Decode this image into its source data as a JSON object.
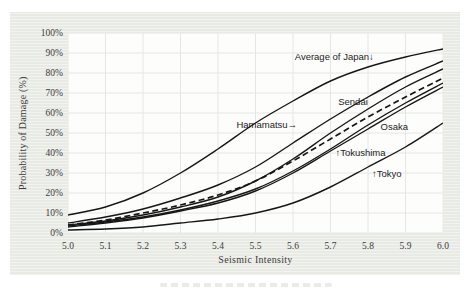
{
  "colors": {
    "curve": "#161616",
    "grid": "#e5e8e2",
    "panel_bg": "#e8eae4",
    "plot_bg": "#fdfdfc",
    "text": "#3b3b3b"
  },
  "chart_data": {
    "type": "line",
    "title": "",
    "xlabel": "Seismic Intensity",
    "ylabel": "Probability of Damage (%)",
    "xlim": [
      5.0,
      6.0
    ],
    "ylim": [
      0,
      100
    ],
    "grid": true,
    "x_ticks": [
      "5.0",
      "5.1",
      "5.2",
      "5.3",
      "5.4",
      "5.5",
      "5.6",
      "5.7",
      "5.8",
      "5.9",
      "6.0"
    ],
    "y_ticks": [
      "0%",
      "10%",
      "20%",
      "30%",
      "40%",
      "50%",
      "60%",
      "70%",
      "80%",
      "90%",
      "100%"
    ],
    "x": [
      5.0,
      5.1,
      5.2,
      5.3,
      5.4,
      5.5,
      5.6,
      5.7,
      5.8,
      5.9,
      6.0
    ],
    "series": [
      {
        "name": "Average of Japan",
        "style": "solid",
        "values": [
          9,
          13,
          20,
          30,
          42,
          55,
          66,
          76,
          83,
          88,
          92
        ]
      },
      {
        "name": "Sendai",
        "style": "solid",
        "values": [
          5,
          8,
          12,
          17.5,
          24,
          33,
          45,
          57,
          68,
          78,
          86
        ]
      },
      {
        "name": "Hamamatsu",
        "style": "solid",
        "values": [
          4,
          6,
          9,
          13,
          18,
          26,
          37,
          50,
          62,
          73,
          82
        ]
      },
      {
        "name": "unlabeled",
        "style": "dashed",
        "values": [
          4,
          6.5,
          10,
          14,
          19,
          26,
          36,
          47,
          58,
          68,
          77.5
        ]
      },
      {
        "name": "Osaka",
        "style": "solid",
        "values": [
          3.5,
          5.5,
          8,
          11.5,
          16,
          22,
          31,
          42,
          54,
          65,
          75
        ]
      },
      {
        "name": "Tokushima",
        "style": "solid",
        "values": [
          3,
          5,
          7.5,
          11,
          15,
          21,
          30,
          41,
          52,
          63,
          73
        ]
      },
      {
        "name": "Tokyo",
        "style": "solid",
        "values": [
          1.5,
          2,
          3,
          5,
          7,
          10,
          15,
          23,
          33,
          43,
          55
        ]
      }
    ],
    "annotations": [
      {
        "text": "Average of Japan↓",
        "x": 5.71,
        "y": 88
      },
      {
        "text": "Sendai",
        "x": 5.76,
        "y": 65.5
      },
      {
        "text": "Hamamatsu→",
        "x": 5.53,
        "y": 54
      },
      {
        "text": "Osaka",
        "x": 5.87,
        "y": 53
      },
      {
        "text": "↑Tokushima",
        "x": 5.78,
        "y": 40
      },
      {
        "text": "↑Tokyo",
        "x": 5.85,
        "y": 29.5
      }
    ]
  }
}
